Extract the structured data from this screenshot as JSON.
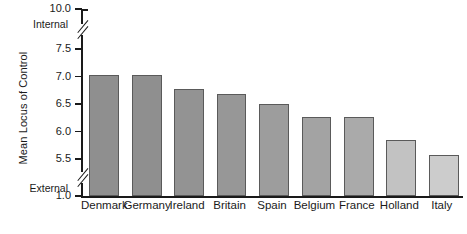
{
  "chart_data": {
    "type": "bar",
    "title": "",
    "xlabel": "",
    "ylabel": "Mean Locus of Control",
    "categories": [
      "Denmark",
      "Germany",
      "Ireland",
      "Britain",
      "Spain",
      "Belgium",
      "France",
      "Holland",
      "Italy"
    ],
    "values": [
      7.02,
      7.02,
      6.77,
      6.69,
      6.5,
      6.27,
      6.27,
      5.85,
      5.57
    ],
    "ylim": [
      1.0,
      10.0
    ],
    "y_tick_labels": [
      "10.0",
      "7.5",
      "7.0",
      "6.5",
      "6.0",
      "5.5",
      "1.0"
    ],
    "y_tick_values": [
      10.0,
      7.5,
      7.0,
      6.5,
      6.0,
      5.5,
      1.0
    ],
    "axis_breaks": [
      "between 7.5 and 10.0",
      "between 5.5 and 1.0"
    ],
    "pole_labels": {
      "high": "Internal",
      "low": "External"
    },
    "grid": false,
    "legend": "none",
    "bar_colors": [
      "#8f8f8f",
      "#8f8f8f",
      "#939393",
      "#979797",
      "#9d9d9d",
      "#a3a3a3",
      "#aaaaaa",
      "#c2c2c2",
      "#cccccc"
    ],
    "bar_border_color": "#5a5a5a",
    "axis_color": "#1a1a1a",
    "background_color": "#ffffff"
  }
}
